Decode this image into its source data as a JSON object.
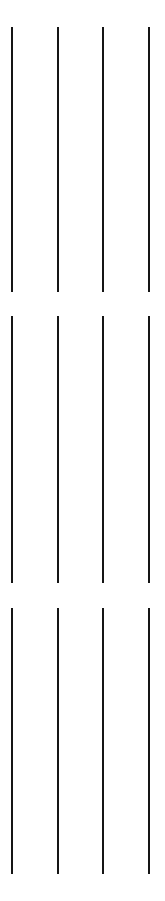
{
  "canvas": {
    "width": 165,
    "height": 901,
    "background_color": "#ffffff"
  },
  "figure": {
    "type": "line-rule-grid",
    "line_color": "#151515",
    "line_width_px": 2,
    "column_count": 4,
    "segments_per_column": 3,
    "column_x_positions": [
      11,
      57,
      102,
      148
    ],
    "column_spacing_px": 45.7,
    "segment_bands": [
      {
        "label": "top-band",
        "top": 27,
        "bottom": 292,
        "height": 265
      },
      {
        "label": "middle-band",
        "top": 316,
        "bottom": 583,
        "height": 267
      },
      {
        "label": "bottom-band",
        "top": 608,
        "bottom": 874,
        "height": 266
      }
    ],
    "gap_bands": [
      {
        "label": "upper-gap",
        "top": 292,
        "bottom": 316,
        "height": 24
      },
      {
        "label": "lower-gap",
        "top": 583,
        "bottom": 608,
        "height": 25
      }
    ],
    "margins": {
      "top": 27,
      "bottom": 27,
      "left": 11,
      "right": 15
    }
  },
  "columns": [
    {
      "name": "column-1",
      "x": 11
    },
    {
      "name": "column-2",
      "x": 57
    },
    {
      "name": "column-3",
      "x": 102
    },
    {
      "name": "column-4",
      "x": 148
    }
  ]
}
